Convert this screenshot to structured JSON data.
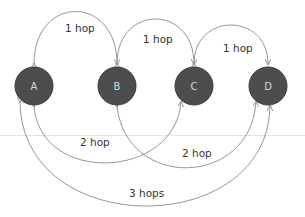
{
  "diagram": {
    "colors": {
      "node_fill": "#4d4d4d",
      "node_stroke": "#3a3a3a",
      "node_text": "#d8d8d8",
      "edge": "#8a8a8a",
      "label": "#333333",
      "divider": "#e4e4e4"
    },
    "nodes": [
      {
        "id": "A",
        "label": "A"
      },
      {
        "id": "B",
        "label": "B"
      },
      {
        "id": "C",
        "label": "C"
      },
      {
        "id": "D",
        "label": "D"
      }
    ],
    "edges": [
      {
        "from": "A",
        "to": "B",
        "label": "1 hop",
        "position": "top"
      },
      {
        "from": "B",
        "to": "C",
        "label": "1 hop",
        "position": "top"
      },
      {
        "from": "C",
        "to": "D",
        "label": "1 hop",
        "position": "top"
      },
      {
        "from": "A",
        "to": "C",
        "label": "2 hop",
        "position": "bottom"
      },
      {
        "from": "B",
        "to": "D",
        "label": "2 hop",
        "position": "bottom"
      },
      {
        "from": "A",
        "to": "D",
        "label": "3 hops",
        "position": "bottom"
      }
    ]
  }
}
